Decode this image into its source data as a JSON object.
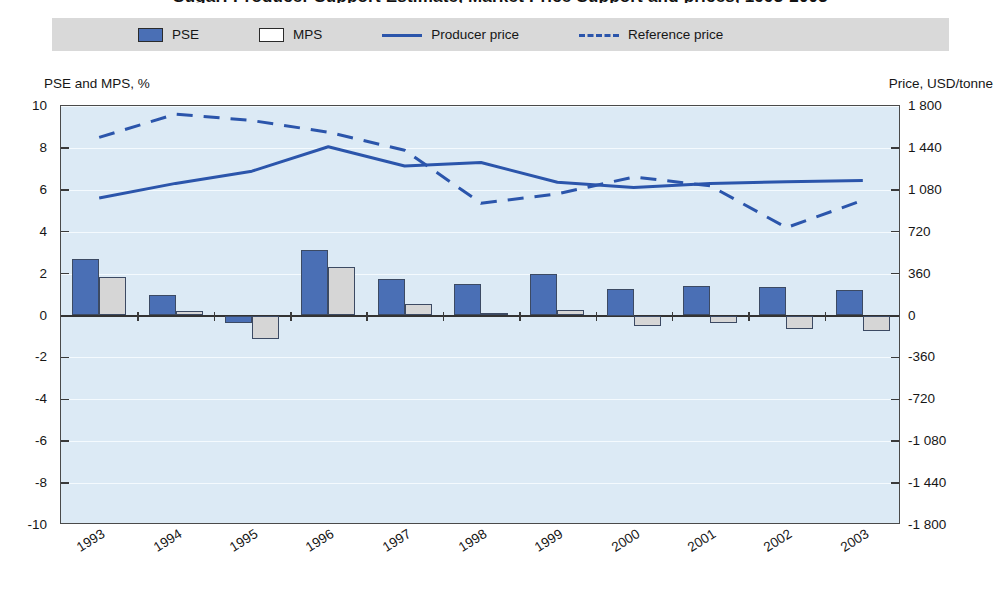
{
  "title": "Sugar: Producer Support Estimate, Market Price Support and prices, 1993-2003",
  "legend": {
    "items": [
      {
        "label": "PSE",
        "icon": "filled-square-swatch",
        "color": "#4a6fb5"
      },
      {
        "label": "MPS",
        "icon": "hollow-square-swatch",
        "color": "#ffffff"
      },
      {
        "label": "Producer price",
        "icon": "solid-line-swatch",
        "color": "#2b55ab"
      },
      {
        "label": "Reference price",
        "icon": "dashed-line-swatch",
        "color": "#2b55ab"
      }
    ],
    "background": "#d9d9d9"
  },
  "axes": {
    "left_caption": "PSE and MPS, %",
    "right_caption": "Price, USD/tonne",
    "left_ticks": [
      "10",
      "8",
      "6",
      "4",
      "2",
      "0",
      "-2",
      "-4",
      "-6",
      "-8",
      "-10"
    ],
    "right_ticks": [
      "1 800",
      "1 440",
      "1 080",
      "720",
      "360",
      "0",
      "-360",
      "-720",
      "-1 080",
      "-1 440",
      "-1 800"
    ]
  },
  "chart_data": {
    "type": "bar",
    "title": "Sugar: Producer Support Estimate, Market Price Support and prices, 1993-2003",
    "xlabel": "",
    "ylabel": "PSE and MPS, %",
    "y2label": "Price, USD/tonne",
    "ylim": [
      -10,
      10
    ],
    "y2lim": [
      -1800,
      1800
    ],
    "ytick_step": 2,
    "y2tick_step": 360,
    "grid": true,
    "legend_position": "top",
    "categories": [
      "1993",
      "1994",
      "1995",
      "1996",
      "1997",
      "1998",
      "1999",
      "2000",
      "2001",
      "2002",
      "2003"
    ],
    "series": [
      {
        "name": "PSE",
        "type": "bar",
        "axis": "left",
        "unit": "%",
        "values": [
          2.7,
          1.0,
          -0.35,
          3.15,
          1.75,
          1.5,
          2.0,
          1.25,
          1.4,
          1.35,
          1.2
        ]
      },
      {
        "name": "MPS",
        "type": "bar",
        "axis": "left",
        "unit": "%",
        "values": [
          1.85,
          0.2,
          -1.1,
          2.3,
          0.55,
          0.1,
          0.25,
          -0.5,
          -0.35,
          -0.65,
          -0.75
        ]
      },
      {
        "name": "Producer price",
        "type": "line",
        "axis": "right",
        "unit": "USD/tonne",
        "style": "solid",
        "values": [
          1010,
          1135,
          1240,
          1450,
          1285,
          1315,
          1145,
          1100,
          1135,
          1150,
          1160
        ]
      },
      {
        "name": "Reference price",
        "type": "line",
        "axis": "right",
        "unit": "USD/tonne",
        "style": "dashed",
        "values": [
          1530,
          1730,
          1675,
          1575,
          1420,
          965,
          1045,
          1190,
          1115,
          755,
          990
        ]
      }
    ]
  }
}
